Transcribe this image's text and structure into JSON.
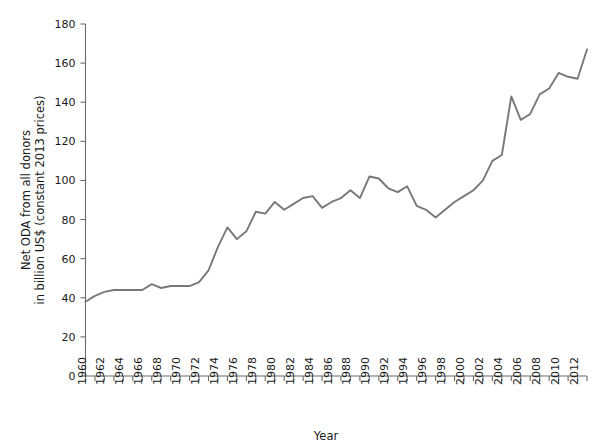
{
  "chart_data": {
    "type": "line",
    "title": "",
    "xlabel": "Year",
    "ylabel": "Net ODA from all donors in billion US$ (constant 2013 prices)",
    "ylabel_line1": "Net ODA from all donors",
    "ylabel_line2": "in billion US$ (constant 2013 prices)",
    "xlim": [
      1960,
      2013
    ],
    "ylim": [
      0,
      180
    ],
    "grid": false,
    "legend": "none",
    "line_color": "#787878",
    "axis_color": "#6b6b6b",
    "text_color": "#1a1a1a",
    "background_color": "#ffffff",
    "y_ticks": [
      0,
      20,
      40,
      60,
      80,
      100,
      120,
      140,
      160,
      180
    ],
    "y_tick_labels": [
      "0",
      "20",
      "40",
      "60",
      "80",
      "100",
      "120",
      "140",
      "160",
      "180"
    ],
    "x_tick_labels": [
      "1960",
      "1962",
      "1964",
      "1966",
      "1968",
      "1970",
      "1972",
      "1974",
      "1976",
      "1978",
      "1980",
      "1982",
      "1984",
      "1986",
      "1988",
      "1990",
      "1992",
      "1994",
      "1996",
      "1998",
      "2000",
      "2002",
      "2004",
      "2006",
      "2008",
      "2010",
      "2012"
    ],
    "x_tick_values": [
      1960,
      1962,
      1964,
      1966,
      1968,
      1970,
      1972,
      1974,
      1976,
      1978,
      1980,
      1982,
      1984,
      1986,
      1988,
      1990,
      1992,
      1994,
      1996,
      1998,
      2000,
      2002,
      2004,
      2006,
      2008,
      2010,
      2012
    ],
    "x_minor_ticks_every": 1,
    "x": [
      1960,
      1961,
      1962,
      1963,
      1964,
      1965,
      1966,
      1967,
      1968,
      1969,
      1970,
      1971,
      1972,
      1973,
      1974,
      1975,
      1976,
      1977,
      1978,
      1979,
      1980,
      1981,
      1982,
      1983,
      1984,
      1985,
      1986,
      1987,
      1988,
      1989,
      1990,
      1991,
      1992,
      1993,
      1994,
      1995,
      1996,
      1997,
      1998,
      1999,
      2000,
      2001,
      2002,
      2003,
      2004,
      2005,
      2006,
      2007,
      2008,
      2009,
      2010,
      2011,
      2012,
      2013
    ],
    "values": [
      38,
      41,
      43,
      44,
      44,
      44,
      44,
      47,
      45,
      46,
      46,
      46,
      48,
      54,
      66,
      76,
      70,
      74,
      84,
      83,
      89,
      85,
      88,
      91,
      92,
      86,
      89,
      91,
      95,
      91,
      102,
      101,
      96,
      94,
      97,
      87,
      85,
      81,
      85,
      89,
      92,
      95,
      100,
      110,
      113,
      143,
      131,
      134,
      144,
      147,
      155,
      153,
      152,
      167
    ],
    "series": [
      {
        "name": "Net ODA from all donors",
        "values": [
          38,
          41,
          43,
          44,
          44,
          44,
          44,
          47,
          45,
          46,
          46,
          46,
          48,
          54,
          66,
          76,
          70,
          74,
          84,
          83,
          89,
          85,
          88,
          91,
          92,
          86,
          89,
          91,
          95,
          91,
          102,
          101,
          96,
          94,
          97,
          87,
          85,
          81,
          85,
          89,
          92,
          95,
          100,
          110,
          113,
          143,
          131,
          134,
          144,
          147,
          155,
          153,
          152,
          167
        ]
      }
    ]
  }
}
